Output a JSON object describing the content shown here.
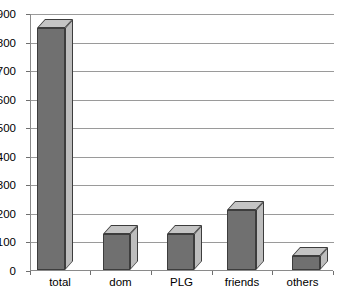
{
  "chart_data": {
    "type": "bar",
    "title": "",
    "subtitle": "",
    "xlabel": "",
    "ylabel": "",
    "categories": [
      "total",
      "dom",
      "PLG",
      "friends",
      "others"
    ],
    "values": [
      850,
      125,
      125,
      210,
      50
    ],
    "series": [
      {
        "name": "",
        "values": [
          850,
          125,
          125,
          210,
          50
        ]
      }
    ],
    "ylim": [
      0,
      900
    ],
    "ytick_values": [
      0,
      100,
      200,
      300,
      400,
      500,
      600,
      700,
      800,
      900
    ],
    "ytick_labels": [
      "0",
      "100",
      "200",
      "300",
      "400",
      "500",
      "600",
      "700",
      "800",
      "900"
    ],
    "grid": true,
    "grid_axis": "y",
    "legend": false,
    "legend_position": "none",
    "style": "3d-column",
    "colors": {
      "bar_front": "#707070",
      "bar_top": "#c4c4c4",
      "bar_side": "#bdbdbd",
      "bar_outline": "#3d3d3d",
      "gridline": "#9a9a9a",
      "axis": "#8a8a8a",
      "background": "#ffffff",
      "text": "#000000"
    },
    "annotations": []
  }
}
